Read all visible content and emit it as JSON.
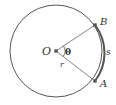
{
  "diagram": {
    "type": "circle-arc-angle",
    "colors": {
      "background": "#ffffff",
      "stroke": "#444444",
      "arc_highlight": "#555555",
      "radius_line": "#666666",
      "point": "#555555",
      "text": "#333333"
    },
    "circle": {
      "cx": 56,
      "cy": 51,
      "r": 46
    },
    "points": [
      {
        "id": "O",
        "label": "O",
        "x": 56,
        "y": 51,
        "label_x": 42,
        "label_y": 55
      },
      {
        "id": "B",
        "label": "B",
        "x": 95,
        "y": 25,
        "label_x": 100,
        "label_y": 25
      },
      {
        "id": "A",
        "label": "A",
        "x": 95,
        "y": 81,
        "label_x": 100,
        "label_y": 87
      }
    ],
    "labels": {
      "angle": {
        "text": "θ",
        "x": 65,
        "y": 55
      },
      "radius": {
        "text": "r",
        "x": 60,
        "y": 67
      },
      "arc": {
        "text": "s",
        "x": 106,
        "y": 55
      }
    }
  }
}
